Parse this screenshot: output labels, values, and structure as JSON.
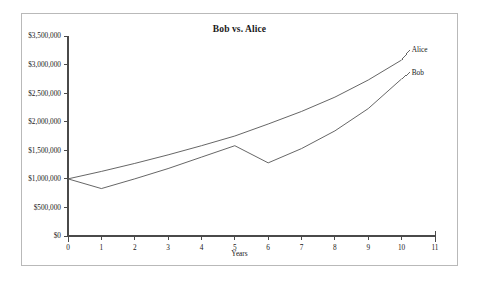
{
  "chart_data": {
    "type": "line",
    "title": "Bob vs. Alice",
    "xlabel": "Years",
    "ylabel": "",
    "xlim": [
      0,
      11
    ],
    "ylim": [
      0,
      3500000
    ],
    "grid": false,
    "legend_position": "line-end-labels",
    "x_tick_labels": [
      "0",
      "1",
      "2",
      "3",
      "4",
      "5",
      "6",
      "7",
      "8",
      "9",
      "10",
      "11"
    ],
    "x_ticks": [
      0,
      1,
      2,
      3,
      4,
      5,
      6,
      7,
      8,
      9,
      10,
      11
    ],
    "y_tick_labels": [
      "$0",
      "$500,000",
      "$1,000,000",
      "$1,500,000",
      "$2,000,000",
      "$2,500,000",
      "$3,000,000",
      "$3,500,000"
    ],
    "y_ticks": [
      0,
      500000,
      1000000,
      1500000,
      2000000,
      2500000,
      3000000,
      3500000
    ],
    "x": [
      0,
      1,
      2,
      3,
      4,
      5,
      6,
      7,
      8,
      9,
      10
    ],
    "series": [
      {
        "name": "Alice",
        "color": "#555555",
        "values": [
          1000000,
          1130000,
          1270000,
          1420000,
          1580000,
          1750000,
          1960000,
          2180000,
          2430000,
          2730000,
          3080000
        ]
      },
      {
        "name": "Bob",
        "color": "#555555",
        "values": [
          1000000,
          830000,
          1000000,
          1180000,
          1380000,
          1580000,
          1280000,
          1530000,
          1840000,
          2230000,
          2750000
        ]
      }
    ],
    "annotations": [
      {
        "text": "Alice",
        "series": "Alice",
        "at_x": 10
      },
      {
        "text": "Bob",
        "series": "Bob",
        "at_x": 10
      }
    ]
  },
  "axis": {
    "line_color": "#4a4a4a",
    "frame_color": "#b9b9b9"
  }
}
